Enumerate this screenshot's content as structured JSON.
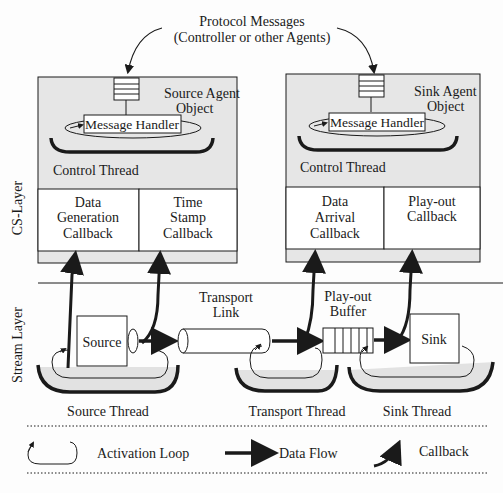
{
  "protocol": {
    "line1": "Protocol Messages",
    "line2": "(Controller or other Agents)"
  },
  "layers": {
    "cs": "CS-Layer",
    "stream": "Stream Layer"
  },
  "source_agent": {
    "title1": "Source Agent",
    "title2": "Object",
    "handler": "Message Handler",
    "thread": "Control Thread",
    "cb1": [
      "Data",
      "Generation",
      "Callback"
    ],
    "cb2": [
      "Time",
      "Stamp",
      "Callback"
    ]
  },
  "sink_agent": {
    "title1": "Sink Agent",
    "title2": "Object",
    "handler": "Message Handler",
    "thread": "Control Thread",
    "cb1": [
      "Data",
      "Arrival",
      "Callback"
    ],
    "cb2": [
      "Play-out",
      "Callback"
    ]
  },
  "stream": {
    "source": "Source",
    "sink": "Sink",
    "link1": "Transport",
    "link2": "Link",
    "buffer1": "Play-out",
    "buffer2": "Buffer",
    "source_thread": "Source Thread",
    "transport_thread": "Transport Thread",
    "sink_thread": "Sink Thread"
  },
  "legend": {
    "activation": "Activation Loop",
    "dataflow": "Data Flow",
    "callback": "Callback"
  },
  "colors": {
    "panel": "#e6e6e6",
    "ink": "#1a1a1a",
    "shadow": "#e0e0e0"
  }
}
